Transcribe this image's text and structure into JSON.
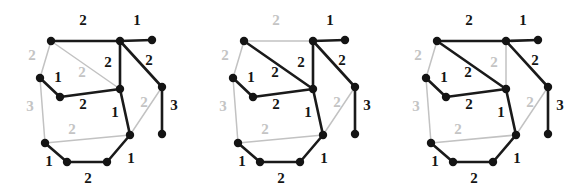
{
  "figure": {
    "title": "",
    "background_color": "#ffffff",
    "panel_count": 3,
    "colors": {
      "dark_edge": "#1a1a1a",
      "light_edge": "#c2c2c2",
      "vertex": "#141414",
      "dark_label": "#141414",
      "light_label": "#c4c4c4"
    }
  },
  "chart_data": {
    "type": "diagram",
    "subtype": "weighted-graph-triptych",
    "title": "",
    "xlabel": "",
    "ylabel": "",
    "vertices": [
      {
        "id": "a",
        "x": 51,
        "y": 41,
        "label": ""
      },
      {
        "id": "b",
        "x": 120,
        "y": 41,
        "label": ""
      },
      {
        "id": "c",
        "x": 152,
        "y": 40,
        "label": ""
      },
      {
        "id": "d",
        "x": 40,
        "y": 78,
        "label": ""
      },
      {
        "id": "e",
        "x": 60,
        "y": 97,
        "label": ""
      },
      {
        "id": "f",
        "x": 120,
        "y": 89,
        "label": ""
      },
      {
        "id": "g",
        "x": 162,
        "y": 87,
        "label": ""
      },
      {
        "id": "h",
        "x": 162,
        "y": 134,
        "label": ""
      },
      {
        "id": "i",
        "x": 45,
        "y": 143,
        "label": ""
      },
      {
        "id": "j",
        "x": 130,
        "y": 135,
        "label": ""
      },
      {
        "id": "k",
        "x": 67,
        "y": 162,
        "label": ""
      },
      {
        "id": "l",
        "x": 107,
        "y": 162,
        "label": ""
      }
    ],
    "edges": [
      {
        "id": "ab",
        "from": "a",
        "to": "b",
        "weight": 2,
        "label_x": 83,
        "label_y": 22
      },
      {
        "id": "bc",
        "from": "b",
        "to": "c",
        "weight": 1,
        "label_x": 137,
        "label_y": 22
      },
      {
        "id": "ad",
        "from": "a",
        "to": "d",
        "weight": 2,
        "label_x": 32,
        "label_y": 57
      },
      {
        "id": "af",
        "from": "a",
        "to": "f",
        "weight": 2,
        "label_x": 82,
        "label_y": 74
      },
      {
        "id": "bf",
        "from": "b",
        "to": "f",
        "weight": 2,
        "label_x": 108,
        "label_y": 64
      },
      {
        "id": "bg",
        "from": "b",
        "to": "g",
        "weight": 2,
        "label_x": 149,
        "label_y": 62
      },
      {
        "id": "de",
        "from": "d",
        "to": "e",
        "weight": 1,
        "label_x": 58,
        "label_y": 79
      },
      {
        "id": "di",
        "from": "d",
        "to": "i",
        "weight": 3,
        "label_x": 30,
        "label_y": 108
      },
      {
        "id": "ef",
        "from": "e",
        "to": "f",
        "weight": 2,
        "label_x": 83,
        "label_y": 106
      },
      {
        "id": "fj",
        "from": "f",
        "to": "j",
        "weight": 1,
        "label_x": 115,
        "label_y": 114
      },
      {
        "id": "gh",
        "from": "g",
        "to": "h",
        "weight": 3,
        "label_x": 174,
        "label_y": 107
      },
      {
        "id": "gj",
        "from": "g",
        "to": "j",
        "weight": 2,
        "label_x": 144,
        "label_y": 104
      },
      {
        "id": "ij",
        "from": "i",
        "to": "j",
        "weight": 2,
        "label_x": 72,
        "label_y": 131
      },
      {
        "id": "ik",
        "from": "i",
        "to": "k",
        "weight": 1,
        "label_x": 49,
        "label_y": 163
      },
      {
        "id": "kl",
        "from": "k",
        "to": "l",
        "weight": 2,
        "label_x": 88,
        "label_y": 180
      },
      {
        "id": "lj",
        "from": "l",
        "to": "j",
        "weight": 1,
        "label_x": 131,
        "label_y": 160
      }
    ],
    "panels": [
      {
        "index": 1,
        "name": "panel-left",
        "caption": "",
        "highlighted_edges": [
          "ab",
          "bc",
          "bf",
          "bg",
          "de",
          "ef",
          "fj",
          "gh",
          "ik",
          "kl",
          "lj"
        ],
        "gray_edges": [
          "ad",
          "af",
          "di",
          "gj",
          "ij"
        ],
        "edge_weight_colors": {
          "ab": "dark",
          "bc": "dark",
          "ad": "light",
          "af": "light",
          "bf": "dark",
          "bg": "dark",
          "de": "dark",
          "di": "light",
          "ef": "dark",
          "fj": "dark",
          "gh": "dark",
          "gj": "light",
          "ij": "light",
          "ik": "dark",
          "kl": "dark",
          "lj": "dark"
        }
      },
      {
        "index": 2,
        "name": "panel-middle",
        "caption": "",
        "highlighted_edges": [
          "bc",
          "af",
          "bf",
          "bg",
          "de",
          "ef",
          "fj",
          "gh",
          "ik",
          "kl",
          "lj"
        ],
        "gray_edges": [
          "ab",
          "ad",
          "di",
          "gj",
          "ij"
        ],
        "edge_weight_colors": {
          "ab": "light",
          "bc": "dark",
          "ad": "light",
          "af": "dark",
          "bf": "dark",
          "bg": "dark",
          "de": "dark",
          "di": "light",
          "ef": "dark",
          "fj": "dark",
          "gh": "dark",
          "gj": "light",
          "ij": "light",
          "ik": "dark",
          "kl": "dark",
          "lj": "dark"
        }
      },
      {
        "index": 3,
        "name": "panel-right",
        "caption": "",
        "highlighted_edges": [
          "ab",
          "bc",
          "af",
          "bg",
          "de",
          "ef",
          "fj",
          "gh",
          "ik",
          "kl",
          "lj"
        ],
        "gray_edges": [
          "ad",
          "bf",
          "di",
          "gj",
          "ij"
        ],
        "edge_weight_colors": {
          "ab": "dark",
          "bc": "dark",
          "ad": "light",
          "af": "dark",
          "bf": "light",
          "bg": "dark",
          "de": "dark",
          "di": "light",
          "ef": "dark",
          "fj": "dark",
          "gh": "dark",
          "gj": "light",
          "ij": "light",
          "ik": "dark",
          "kl": "dark",
          "lj": "dark"
        }
      }
    ]
  }
}
